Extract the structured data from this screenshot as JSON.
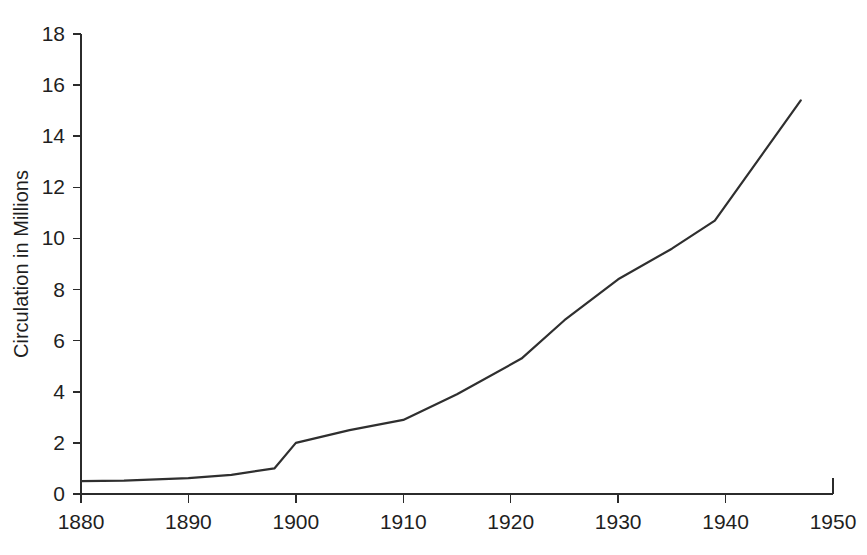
{
  "chart_data": {
    "type": "line",
    "title": "",
    "xlabel": "",
    "ylabel": "Circulation in Millions",
    "xlim": [
      1880,
      1950
    ],
    "ylim": [
      0,
      18
    ],
    "grid": false,
    "legend": null,
    "line_color": "#2f2f2f",
    "background_color": "#ffffff",
    "xticks": [
      1880,
      1890,
      1900,
      1910,
      1920,
      1930,
      1940,
      1950
    ],
    "xtick_labels": [
      "1880",
      "1890",
      "1900",
      "1910",
      "1920",
      "1930",
      "1940",
      "1950"
    ],
    "yticks": [
      0,
      2,
      4,
      6,
      8,
      10,
      12,
      14,
      16,
      18
    ],
    "ytick_labels": [
      "0",
      "2",
      "4",
      "6",
      "8",
      "10",
      "12",
      "14",
      "16",
      "18"
    ],
    "series": [
      {
        "name": "Circulation",
        "x": [
          1880,
          1884,
          1890,
          1894,
          1898,
          1900,
          1905,
          1910,
          1915,
          1921,
          1925,
          1930,
          1935,
          1939,
          1947
        ],
        "values": [
          0.5,
          0.52,
          0.62,
          0.75,
          1.0,
          2.0,
          2.5,
          2.9,
          3.9,
          5.3,
          6.8,
          8.4,
          9.6,
          10.7,
          15.4
        ]
      }
    ]
  }
}
